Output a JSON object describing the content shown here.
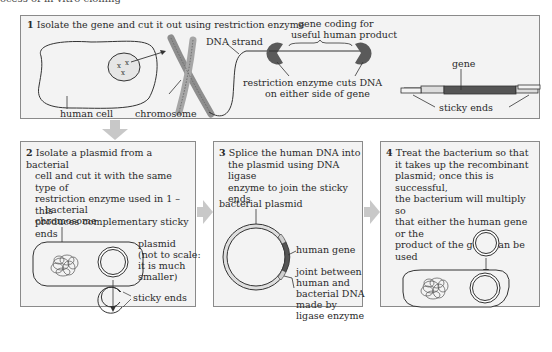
{
  "figure": {
    "caption": "ocess of in vitro cloning"
  },
  "panels": [
    {
      "number": "1",
      "title": "Isolate the gene and cut it out using restriction enzyme",
      "labels": {
        "human_cell": "human cell",
        "chromosome": "chromosome",
        "dna_strand": "DNA strand",
        "gene_coding_1": "gene  coding for",
        "gene_coding_2": "useful human product",
        "enzyme_cuts_1": "restriction enzyme cuts DNA",
        "enzyme_cuts_2": "on either side of gene",
        "gene": "gene",
        "sticky_ends": "sticky ends"
      }
    },
    {
      "number": "2",
      "title_lines": [
        "Isolate a plasmid from a bacterial",
        "cell and cut it with the same type of",
        "restriction enzyme used in 1 – this",
        "produces complementary sticky ends"
      ],
      "labels": {
        "bacterial_chromosome_1": "bacterial",
        "bacterial_chromosome_2": "chromosome",
        "plasmid_1": "plasmid",
        "plasmid_2": "(not to scale:",
        "plasmid_3": "it is much",
        "plasmid_4": "smaller)",
        "sticky_ends": "sticky ends"
      }
    },
    {
      "number": "3",
      "title_lines": [
        "Splice the human DNA into",
        "the plasmid using DNA ligase",
        "enzyme to join the sticky ends"
      ],
      "labels": {
        "bacterial_plasmid": "bacterial plasmid",
        "human_gene": "human gene",
        "joint_1": "joint between",
        "joint_2": "human and",
        "joint_3": "bacterial DNA",
        "joint_4": "made by",
        "joint_5": "ligase enzyme"
      }
    },
    {
      "number": "4",
      "title_lines": [
        "Treat the bacterium so that",
        "it takes up the recombinant",
        "plasmid; once this is successful,",
        "the  bacterium will multiply so",
        "that either the human gene or the",
        "product of the gene can be used"
      ]
    }
  ],
  "colors": {
    "panel_bg": "#f3f3f3",
    "panel_border": "#8a8a8a",
    "flow_arrow": "#c8c8c8",
    "enzyme": "#5a5a5a",
    "gene": "#555555",
    "sticky": "#dcdcdc",
    "chromosome": "#9a9a9a"
  }
}
